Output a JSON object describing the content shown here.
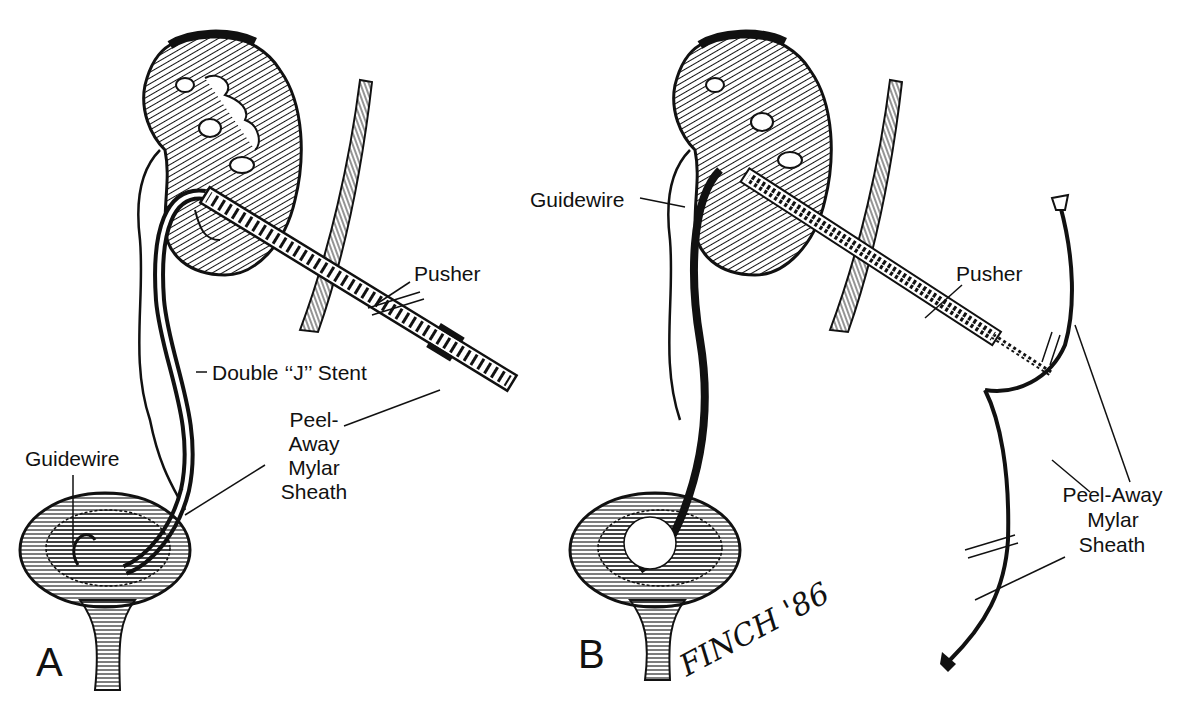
{
  "figure": {
    "panels": [
      {
        "id": "A",
        "letter": "A",
        "labels": {
          "guidewire": "Guidewire",
          "pusher": "Pusher",
          "stent": "Double ‘‘J’’ Stent",
          "sheath_line1": "Peel-",
          "sheath_line2": "Away",
          "sheath_line3": "Mylar",
          "sheath_line4": "Sheath"
        }
      },
      {
        "id": "B",
        "letter": "B",
        "labels": {
          "guidewire": "Guidewire",
          "pusher": "Pusher",
          "sheath_line1": "Peel-Away",
          "sheath_line2": "Mylar",
          "sheath_line3": "Sheath"
        }
      }
    ],
    "signature": "FINCH '86",
    "colors": {
      "ink": "#111111",
      "paper": "#ffffff"
    }
  }
}
